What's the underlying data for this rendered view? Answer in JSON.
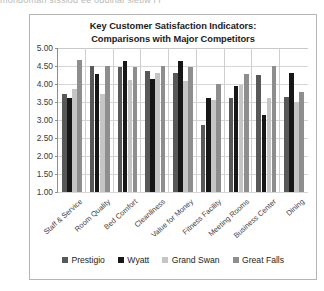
{
  "clipped_top_text": "mondoman sissiod ee oddinal sietiw i i",
  "chart_data": {
    "type": "bar",
    "title": "Key Customer Satisfaction Indicators: Comparisons with Major Competitors",
    "title_lines": [
      "Key Customer Satisfaction Indicators:",
      "Comparisons with Major Competitors"
    ],
    "xlabel": "",
    "ylabel": "",
    "ylim": [
      1.0,
      5.0
    ],
    "ytick_step": 0.5,
    "ytick_labels": [
      "5.00",
      "4.50",
      "4.00",
      "3.50",
      "3.00",
      "2.50",
      "2.00",
      "1.50",
      "1.00"
    ],
    "grid": true,
    "legend_position": "bottom",
    "categories": [
      "Staff & Service",
      "Room Quality",
      "Bed Comfort",
      "Cleanliness",
      "Value for Money",
      "Fitness Facility",
      "Meeting Rooms",
      "Business Center",
      "Dining"
    ],
    "series": [
      {
        "name": "Prestigio",
        "color": "#585858",
        "values": [
          3.72,
          4.5,
          4.47,
          4.35,
          4.3,
          2.85,
          3.6,
          4.25,
          3.65
        ]
      },
      {
        "name": "Wyatt",
        "color": "#171717",
        "values": [
          3.62,
          4.28,
          4.65,
          4.15,
          4.65,
          3.6,
          3.95,
          3.15,
          4.3
        ]
      },
      {
        "name": "Grand Swan",
        "color": "#c5c5c5",
        "values": [
          3.85,
          3.72,
          4.1,
          4.3,
          4.07,
          3.55,
          3.97,
          3.62,
          3.5
        ]
      },
      {
        "name": "Great Falls",
        "color": "#8e8e8e",
        "values": [
          4.67,
          4.5,
          4.48,
          4.5,
          4.48,
          4.0,
          4.28,
          4.5,
          3.77
        ]
      }
    ]
  }
}
